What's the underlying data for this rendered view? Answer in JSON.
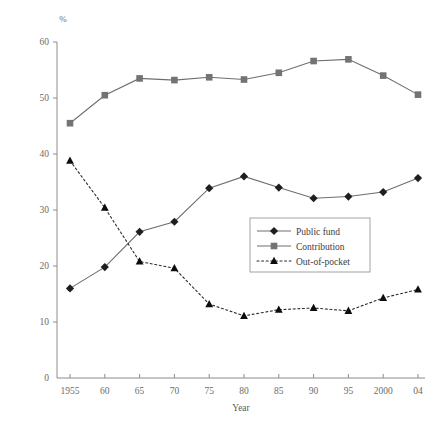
{
  "chart_data": {
    "type": "line",
    "title": "",
    "xlabel": "Year",
    "ylabel": "",
    "unit_label": "%",
    "x": [
      "1955",
      "60",
      "65",
      "70",
      "75",
      "80",
      "85",
      "90",
      "95",
      "2000",
      "04"
    ],
    "categories": [
      "1955",
      "60",
      "65",
      "70",
      "75",
      "80",
      "85",
      "90",
      "95",
      "2000",
      "04"
    ],
    "xlim": [
      0,
      10
    ],
    "ylim": [
      0,
      60
    ],
    "yticks": [
      0,
      10,
      20,
      30,
      40,
      50,
      60
    ],
    "ytick_labels": [
      "0",
      "10",
      "20",
      "30",
      "40",
      "50",
      "60"
    ],
    "grid": false,
    "legend_position": "center-right-inside",
    "series": [
      {
        "name": "Public fund",
        "marker": "diamond",
        "linestyle": "solid",
        "color": "#1f1f1f",
        "values": [
          16.0,
          19.8,
          26.1,
          27.9,
          33.9,
          36.0,
          34.0,
          32.1,
          32.4,
          33.2,
          35.7
        ]
      },
      {
        "name": "Contribution",
        "marker": "square",
        "linestyle": "solid",
        "color": "#737373",
        "values": [
          45.5,
          50.5,
          53.5,
          53.2,
          53.7,
          53.3,
          54.5,
          56.6,
          56.9,
          54.0,
          50.6
        ]
      },
      {
        "name": "Out-of-pocket",
        "marker": "triangle",
        "linestyle": "dotted",
        "color": "#0d0d0d",
        "values": [
          38.8,
          30.4,
          20.8,
          19.6,
          13.2,
          11.1,
          12.2,
          12.5,
          12.0,
          14.3,
          15.8
        ]
      }
    ]
  },
  "legend": {
    "items": [
      {
        "label": "Public fund"
      },
      {
        "label": "Contribution"
      },
      {
        "label": "Out-of-pocket"
      }
    ]
  },
  "axes": {
    "y_unit": "%",
    "x_title": "Year"
  }
}
